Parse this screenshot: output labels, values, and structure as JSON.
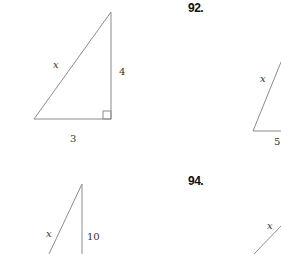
{
  "problems": [
    {
      "number": "",
      "figure": {
        "type": "right-triangle",
        "hypotenuse_label": "x",
        "vertical_leg_label": "4",
        "horizontal_leg_label": "3",
        "right_angle_marker": true
      }
    },
    {
      "number": "92.",
      "figure": {
        "type": "right-triangle (partially visible)",
        "hypotenuse_label": "x",
        "horizontal_leg_label": "5"
      }
    },
    {
      "number": "",
      "figure": {
        "type": "right-triangle (partially visible)",
        "hypotenuse_label": "x",
        "vertical_leg_label": "10"
      }
    },
    {
      "number": "94.",
      "figure": {
        "type": "triangle (partially visible)",
        "side_label": "x"
      }
    }
  ],
  "colors": {
    "line": "#9a9a9a",
    "text": "#333333",
    "number": "#111111"
  }
}
